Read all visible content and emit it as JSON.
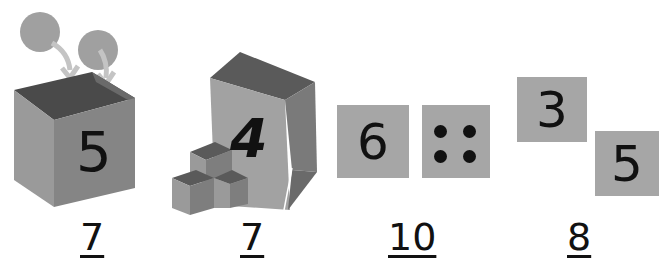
{
  "problems": [
    {
      "id": "box",
      "description": "Box containing 5 with 2 balls going in",
      "box_number": "5",
      "incoming_balls": 2,
      "answer": "7"
    },
    {
      "id": "bag",
      "description": "Bag containing 4 with 3 cubes beside",
      "bag_number": "4",
      "cubes": 3,
      "answer": "7"
    },
    {
      "id": "cards-dots",
      "description": "Card 6 and card with 4 dots",
      "card_number": "6",
      "dot_count": 4,
      "answer": "10"
    },
    {
      "id": "two-cards",
      "description": "Cards 3 and 5",
      "card_a": "3",
      "card_b": "5",
      "answer": "8"
    }
  ],
  "colors": {
    "gray": "#a6a6a6",
    "dark_gray": "#5e5e5e",
    "mid_gray": "#8a8a8a",
    "ink": "#111111"
  }
}
